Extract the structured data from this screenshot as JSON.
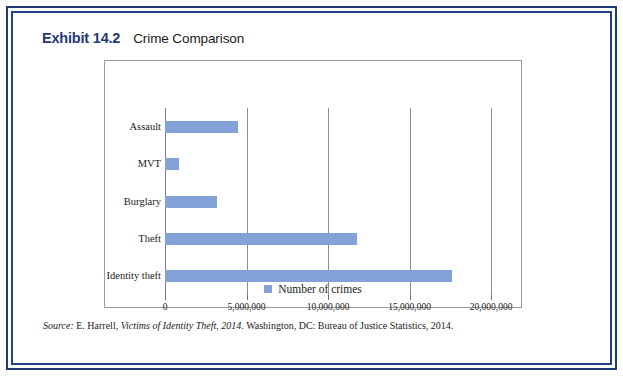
{
  "exhibit": {
    "label": "Exhibit 14.2",
    "title": "Crime Comparison"
  },
  "source": {
    "prefix": "Source:",
    "author": " E. Harrell, ",
    "work": "Victims of Identity Theft, 2014",
    "rest": ". Washington, DC: Bureau of Justice Statistics, 2014."
  },
  "legend": {
    "marker_name": "legend-color-swatch",
    "label": "Number of crimes",
    "color": "#83a2d8"
  },
  "chart_data": {
    "type": "bar",
    "orientation": "horizontal",
    "title": "Crime Comparison",
    "xlabel": "",
    "ylabel": "",
    "xlim": [
      0,
      20000000
    ],
    "grid": true,
    "legend_position": "bottom",
    "series_name": "Number of crimes",
    "bar_color": "#83a2d8",
    "categories": [
      "Identity theft",
      "Theft",
      "Burglary",
      "MVT",
      "Assault"
    ],
    "values": [
      17600000,
      11800000,
      3200000,
      850000,
      4450000
    ],
    "xticks": [
      0,
      5000000,
      10000000,
      15000000,
      20000000
    ],
    "xticklabels": [
      "0",
      "5,000,000",
      "10,000,000",
      "15,000,000",
      "20,000,000"
    ],
    "bars": [
      {
        "category": "Assault",
        "value": 4450000,
        "label": "Assault"
      },
      {
        "category": "MVT",
        "value": 850000,
        "label": "MVT"
      },
      {
        "category": "Burglary",
        "value": 3200000,
        "label": "Burglary"
      },
      {
        "category": "Theft",
        "value": 11800000,
        "label": "Theft"
      },
      {
        "category": "Identity theft",
        "value": 17600000,
        "label": "Identity theft"
      }
    ]
  }
}
